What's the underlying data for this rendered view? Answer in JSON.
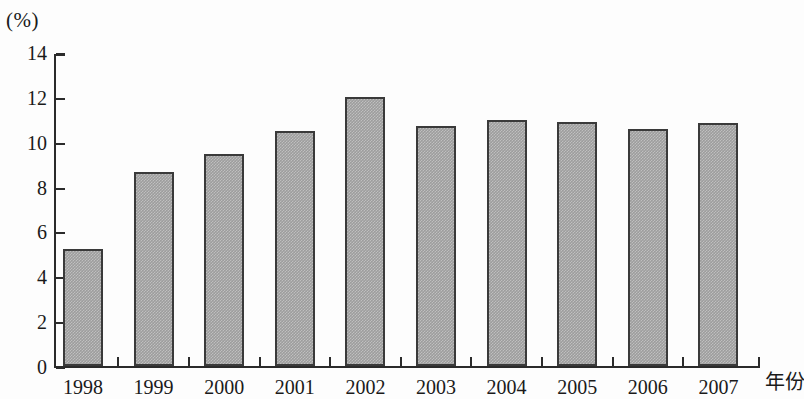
{
  "chart_data": {
    "type": "bar",
    "title": "",
    "subtitle": "",
    "xlabel": "年份",
    "ylabel": "",
    "unit_label": "(%)",
    "categories": [
      "1998",
      "1999",
      "2000",
      "2001",
      "2002",
      "2003",
      "2004",
      "2005",
      "2006",
      "2007"
    ],
    "values": [
      5.2,
      8.65,
      9.45,
      10.5,
      12.0,
      10.7,
      10.95,
      10.9,
      10.55,
      10.85
    ],
    "series": [
      {
        "name": "",
        "values": [
          5.2,
          8.65,
          9.45,
          10.5,
          12.0,
          10.7,
          10.95,
          10.9,
          10.55,
          10.85
        ]
      }
    ],
    "ylim": [
      0,
      14
    ],
    "yticks": [
      "0",
      "2",
      "4",
      "6",
      "8",
      "10",
      "12",
      "14"
    ],
    "ytick_values": [
      0,
      2,
      4,
      6,
      8,
      10,
      12,
      14
    ],
    "grid": false,
    "legend": false,
    "legend_position": "none",
    "bar_fill_color": "#9d9d9d",
    "bar_border_color": "#3a3a3a",
    "axis_color": "#2b2b2b",
    "background_color": "#fdfdfd"
  }
}
